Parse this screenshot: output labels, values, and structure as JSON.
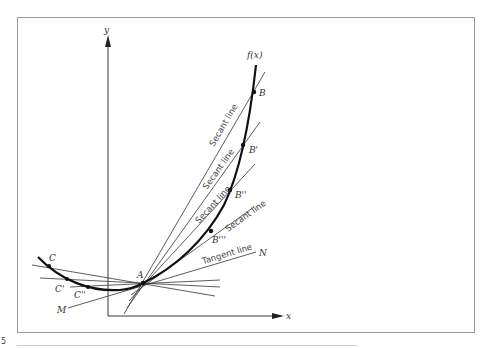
{
  "figure": {
    "number_fragment": "5",
    "axis_labels": {
      "x": "x",
      "y": "y"
    },
    "function_label": "f(x)",
    "points": {
      "A": "A",
      "B": "B",
      "B1": "B'",
      "B2": "B''",
      "B3": "B'''",
      "C": "C",
      "C1": "C'",
      "C2": "C''",
      "M": "M",
      "N": "N"
    },
    "line_labels": {
      "secant_1": "Secant line",
      "secant_2": "Secant line",
      "secant_3": "Secant line",
      "secant_4": "Secant line",
      "tangent": "Tangent line"
    },
    "caption_concept": "Secant lines AB, AB', AB'', AB''' and AC, AC', AC'' approach the tangent line MN at point A"
  }
}
